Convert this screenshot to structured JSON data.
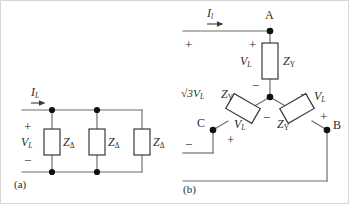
{
  "figure": {
    "background": "#ffffff",
    "line_color": "#6f6f6f",
    "text_color": "#2b2b2b",
    "node_color": "#111111",
    "border_color": "#c9c9c9"
  },
  "panel_a": {
    "caption": "(a)",
    "current_label": "I",
    "current_sub": "L",
    "voltage_label": "V",
    "voltage_sub": "L",
    "plus_sign": "+",
    "minus_sign": "−",
    "impedance_1": "Z",
    "impedance_1_sub": "Δ",
    "impedance_2": "Z",
    "impedance_2_sub": "Δ",
    "impedance_3": "Z",
    "impedance_3_sub": "Δ"
  },
  "panel_b": {
    "caption": "(b)",
    "current_label": "I",
    "current_sub": "l",
    "node_a": "A",
    "node_b": "B",
    "node_c": "C",
    "plus_left": "+",
    "plus_top": "+",
    "minus_left": "−",
    "minus_top": "−",
    "source_voltage": "√3V",
    "source_voltage_sub": "L",
    "branch_a_voltage": "V",
    "branch_a_voltage_sub": "L",
    "branch_a_impedance": "Z",
    "branch_a_impedance_sub": "Y",
    "branch_c_voltage": "V",
    "branch_c_voltage_sub": "L",
    "branch_c_impedance": "Z",
    "branch_c_impedance_sub": "Y",
    "branch_b_voltage": "V",
    "branch_b_voltage_sub": "L",
    "branch_b_impedance": "Z",
    "branch_b_impedance_sub": "Y",
    "center_minus": "−",
    "center_minus_2": "−",
    "branch_b_minus": "−",
    "branch_b_plus": "+",
    "branch_c_plus": "+"
  }
}
